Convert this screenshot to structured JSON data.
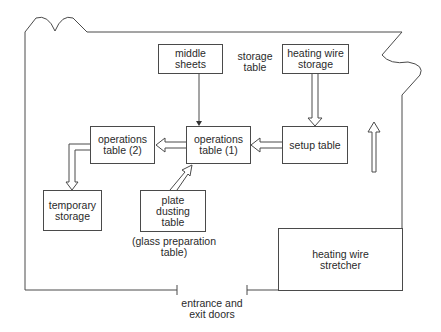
{
  "diagram": {
    "type": "floor-plan-workflow",
    "stations": {
      "middle_sheets": "middle\nsheets",
      "storage_table": "storage\ntable",
      "heating_wire_storage": "heating wire\nstorage",
      "operations_table_1": "operations\ntable (1)",
      "operations_table_2": "operations\ntable (2)",
      "setup_table": "setup table",
      "temporary_storage": "temporary\nstorage",
      "plate_dusting_table": "plate\ndusting\ntable",
      "glass_preparation_note": "(glass preparation\ntable)",
      "heating_wire_stretcher": "heating wire\nstretcher",
      "entrance": "entrance and\nexit doors"
    },
    "flows": [
      {
        "from": "middle sheets",
        "to": "operations table (1)",
        "style": "thin-arrow"
      },
      {
        "from": "heating wire storage",
        "to": "setup table",
        "style": "hollow-arrow"
      },
      {
        "from": "setup table",
        "to": "operations table (1)",
        "style": "hollow-arrow"
      },
      {
        "from": "operations table (1)",
        "to": "operations table (2)",
        "style": "hollow-arrow"
      },
      {
        "from": "operations table (2)",
        "to": "temporary storage",
        "style": "hollow-arrow"
      },
      {
        "from": "plate dusting table",
        "to": "operations table (1)",
        "style": "hollow-arrow"
      },
      {
        "from": "heating wire stretcher area",
        "to": "up",
        "style": "hollow-arrow"
      }
    ],
    "colors": {
      "line": "#4a4a4a",
      "background": "#ffffff"
    }
  }
}
